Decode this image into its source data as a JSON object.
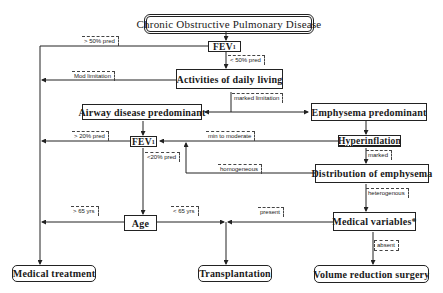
{
  "diagram": {
    "title": "Chronic Obstructive Pulmonary Disease",
    "nodes": {
      "fev1_top": {
        "main": "FEV",
        "sub": "1"
      },
      "adl": "Activities of daily living",
      "airway": "Airway disease predominant",
      "emphysema": "Emphysema predominant",
      "fev1_mid": {
        "main": "FEV",
        "sub": "1"
      },
      "hyperinflation": "Hyperinflation",
      "distribution": "Distribution of emphysema",
      "age": "Age",
      "medical_variables": "Medical variables*",
      "medical_treatment": "Medical treatment",
      "transplantation": "Transplantation",
      "volume_reduction": "Volume reduction surgery"
    },
    "edge_labels": {
      "gt50": "> 50% pred",
      "lt50": "< 50% pred",
      "mod_limitation": "Mod limitation",
      "marked_limitation": "marked limitation",
      "gt20": "> 20% pred",
      "min_to_moderate": "min to moderate",
      "marked": "marked",
      "lt20": "<20% pred",
      "homogeneous": "homogeneous",
      "heterogeneous": "heterogenous",
      "gt65": "> 65 yrs",
      "lt65": "< 65 yrs",
      "present": "present",
      "absent": "absent"
    }
  }
}
